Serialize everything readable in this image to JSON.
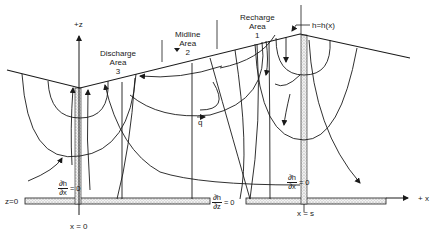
{
  "figure": {
    "axes": {
      "z_axis_label": "+z",
      "x_axis_label": "+ x",
      "z_origin_label": "z=0",
      "x_origin_label": "x = 0",
      "x_end_label": "x = s"
    },
    "areas": [
      {
        "name": "Discharge",
        "line2": "Area",
        "number": "3"
      },
      {
        "name": "Midline",
        "line2": "Area",
        "number": "2"
      },
      {
        "name": "Recharge",
        "line2": "Area",
        "number": "1"
      }
    ],
    "water_table_label": "h=h(x)",
    "flux_vector_label": "q",
    "boundary_conditions": {
      "left": {
        "num": "∂h",
        "den": "∂x",
        "eq": "= 0"
      },
      "bottom": {
        "num": "∂h",
        "den": "∂z",
        "eq": "= 0"
      },
      "right": {
        "num": "∂h",
        "den": "∂x",
        "eq": "= 0"
      }
    },
    "colors": {
      "line": "#1a1a1a",
      "stipple": "#bdbdbd"
    }
  }
}
